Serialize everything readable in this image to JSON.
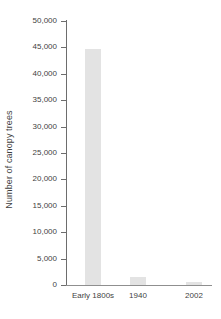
{
  "chart_data": {
    "type": "bar",
    "title": "",
    "xlabel": "",
    "ylabel": "Number of canopy trees",
    "categories": [
      "Early 1800s",
      "1940",
      "2002"
    ],
    "values": [
      44700,
      1500,
      550
    ],
    "ylim": [
      0,
      50000
    ],
    "ytick_values": [
      0,
      5000,
      10000,
      15000,
      20000,
      25000,
      30000,
      35000,
      40000,
      45000,
      50000
    ],
    "ytick_labels": [
      "0",
      "5,000",
      "10,000",
      "15,000",
      "20,000",
      "25,000",
      "30,000",
      "35,000",
      "40,000",
      "45,000",
      "50,000"
    ],
    "grid": false,
    "legend": false,
    "bar_color": "#e3e3e3",
    "axis_color": "#6d6d6d",
    "text_color": "#3f3f3f",
    "background_color": "#ffffff"
  }
}
